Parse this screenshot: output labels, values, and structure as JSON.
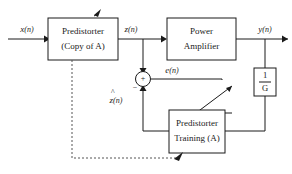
{
  "diagram": {
    "colors": {
      "line": "#1a1a1a",
      "dashed_line": "#555555",
      "background": "#ffffff",
      "text": "#1a1a1a"
    },
    "blocks": [
      {
        "id": "predistorter",
        "line1": "Predistorter",
        "line2": "(Copy of A)"
      },
      {
        "id": "power-amplifier",
        "line1": "Power",
        "line2": "Amplifier"
      },
      {
        "id": "predistorter-training",
        "line1": "Predistorter",
        "line2": "Training (A)"
      },
      {
        "id": "inverse-gain",
        "numerator": "1",
        "denominator": "G"
      }
    ],
    "signals": [
      {
        "id": "input",
        "base": "x",
        "index": "(n)",
        "label": "x(n)"
      },
      {
        "id": "predistorted",
        "base": "z",
        "index": "(n)",
        "label": "z(n)"
      },
      {
        "id": "output",
        "base": "y",
        "index": "(n)",
        "label": "y(n)"
      },
      {
        "id": "error",
        "base": "e",
        "index": "(n)",
        "label": "e(n)"
      },
      {
        "id": "z-hat",
        "base": "z",
        "index": "(n)",
        "label": "z(n)",
        "hat": "^"
      }
    ],
    "summing_junction": {
      "id": "summing-junction",
      "plus_sign": "+",
      "minus_sign": "−"
    }
  }
}
